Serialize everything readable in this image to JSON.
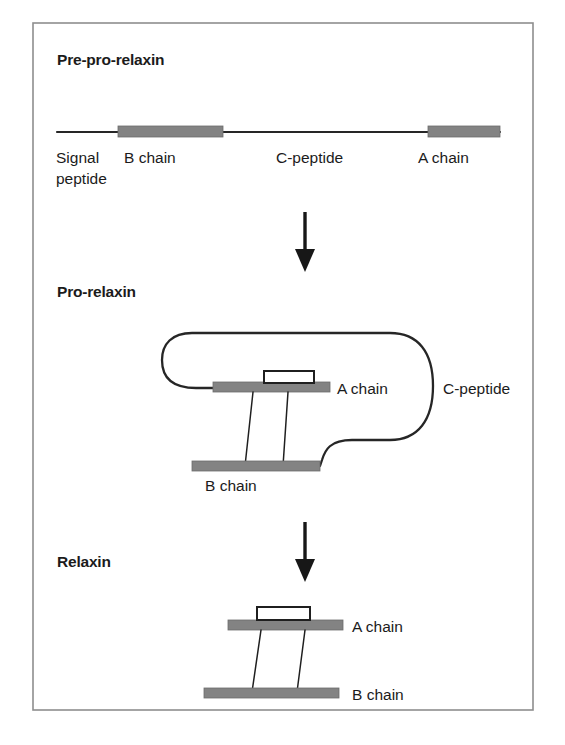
{
  "figure": {
    "title_semantic": "relaxin-biosynthesis-processing-diagram",
    "frame": {
      "stroke_color": "#8e8e8e"
    },
    "palette": {
      "chain_bar_gray": "#838383",
      "line_black": "#262626",
      "text_black": "#1b1b1b",
      "background": "#ffffff"
    }
  },
  "stages": [
    {
      "id": "pre-pro-relaxin",
      "title": "Pre-pro-relaxin",
      "labels": [
        {
          "id": "signal-peptide",
          "line1": "Signal",
          "line2": "peptide"
        },
        {
          "id": "b-chain",
          "text": "B chain"
        },
        {
          "id": "c-peptide",
          "text": "C-peptide"
        },
        {
          "id": "a-chain",
          "text": "A chain"
        }
      ]
    },
    {
      "id": "pro-relaxin",
      "title": "Pro-relaxin",
      "labels": [
        {
          "id": "a-chain",
          "text": "A chain"
        },
        {
          "id": "b-chain",
          "text": "B chain"
        },
        {
          "id": "c-peptide",
          "text": "C-peptide"
        }
      ]
    },
    {
      "id": "relaxin",
      "title": "Relaxin",
      "labels": [
        {
          "id": "a-chain",
          "text": "A chain"
        },
        {
          "id": "b-chain",
          "text": "B chain"
        }
      ]
    }
  ],
  "arrows": [
    {
      "id": "arrow-pre-pro-to-pro",
      "direction": "down"
    },
    {
      "id": "arrow-pro-to-relaxin",
      "direction": "down"
    }
  ]
}
